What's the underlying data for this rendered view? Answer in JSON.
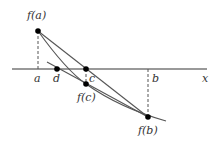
{
  "diagram": {
    "axis_label": "x",
    "point_labels": {
      "fa": "f(a)",
      "fb": "f(b)",
      "fc": "f(c)",
      "a": "a",
      "b": "b",
      "c": "c",
      "d": "d"
    },
    "colors": {
      "line": "#555555",
      "axis": "#777777",
      "point": "#000000",
      "text": "#333333"
    }
  }
}
